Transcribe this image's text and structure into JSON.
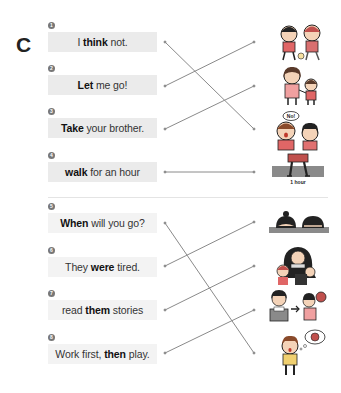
{
  "section": {
    "letter": "C"
  },
  "items": [
    {
      "number": "1",
      "pre": "I ",
      "bold": "think",
      "post": " not."
    },
    {
      "number": "2",
      "pre": "",
      "bold": "Let",
      "post": " me go!"
    },
    {
      "number": "3",
      "pre": "",
      "bold": "Take",
      "post": " your brother."
    },
    {
      "number": "4",
      "pre": "",
      "bold": "walk",
      "post": " for an hour"
    },
    {
      "number": "5",
      "pre": "",
      "bold": "When",
      "post": " will you go?"
    },
    {
      "number": "6",
      "pre": "They ",
      "bold": "were",
      "post": " tired."
    },
    {
      "number": "7",
      "pre": "read ",
      "bold": "them",
      "post": " stories"
    },
    {
      "number": "8",
      "pre": "Work first, ",
      "bold": "then",
      "post": " play."
    }
  ],
  "pictures": [
    {
      "icon": "kids-playing-ball-picture"
    },
    {
      "icon": "mother-and-child-holding-hands-picture"
    },
    {
      "icon": "kids-saying-no-picture",
      "speech": "No!"
    },
    {
      "icon": "person-walking-picture",
      "caption": "1 hour"
    },
    {
      "icon": "kids-sleeping-at-desk-picture"
    },
    {
      "icon": "adult-reading-to-children-picture"
    },
    {
      "icon": "study-then-play-picture"
    },
    {
      "icon": "boy-thinking-picture"
    }
  ],
  "matches": [
    {
      "from": 1,
      "to": 3
    },
    {
      "from": 2,
      "to": 1
    },
    {
      "from": 3,
      "to": 2
    },
    {
      "from": 4,
      "to": 4
    },
    {
      "from": 5,
      "to": 8
    },
    {
      "from": 6,
      "to": 5
    },
    {
      "from": 7,
      "to": 6
    },
    {
      "from": 8,
      "to": 7
    }
  ],
  "colors": {
    "line": "#8a8a8a",
    "box_top": "#ebebeb",
    "box_bottom": "#f3f3f3",
    "number_badge": "#777777"
  }
}
